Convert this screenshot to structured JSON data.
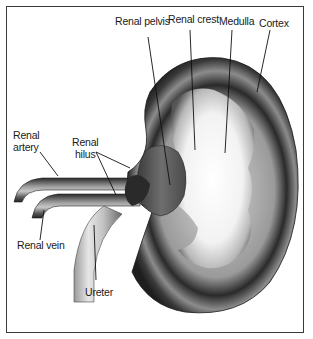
{
  "diagram": {
    "labels": {
      "renal_pelvis": "Renal pelvis",
      "renal_crest": "Renal crest",
      "medulla": "Medulla",
      "cortex": "Cortex",
      "renal_artery_line1": "Renal",
      "renal_artery_line2": "artery",
      "renal_hilus_line1": "Renal",
      "renal_hilus_line2": "hilus",
      "renal_vein": "Renal vein",
      "ureter": "Ureter"
    },
    "colors": {
      "frame": "#3a3a3a",
      "cortex_dark": "#2b2b2b",
      "cortex_mid": "#7a7a7a",
      "medulla_light": "#f4f4f4",
      "pelvis": "#5a5a5a",
      "vessel_dark": "#2e2e2e",
      "vessel_light": "#bdbdbd",
      "leader_line": "#111111"
    }
  }
}
